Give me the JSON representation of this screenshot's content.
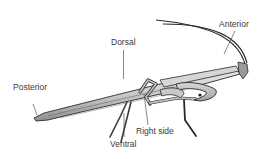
{
  "diagram": {
    "labels": {
      "dorsal": "Dorsal",
      "anterior": "Anterior",
      "posterior": "Posterior",
      "ventral": "Ventral",
      "right_side": "Right side"
    },
    "colors": {
      "outline": "#2a2a2a",
      "body_light": "#dcdcdc",
      "body_mid": "#b8b8b8",
      "body_dark": "#8e8e8e",
      "text": "#3a3a3a",
      "leader": "#555555"
    }
  }
}
